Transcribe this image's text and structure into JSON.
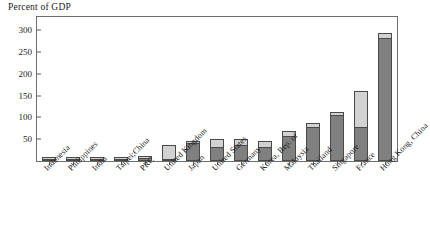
{
  "chart_data": {
    "type": "bar",
    "stacked": true,
    "title": "",
    "ylabel": "Percent of GDP",
    "xlabel": "",
    "ylim": [
      0,
      330
    ],
    "yticks": [
      50,
      100,
      150,
      200,
      250,
      300
    ],
    "grid": false,
    "legend_position": "top-left",
    "categories": [
      "Indonesia",
      "Philippines",
      "India",
      "Taipei;China",
      "PRC",
      "United Kingdom",
      "Japan",
      "United States",
      "Germany",
      "Korea, Rep. of",
      "Malaysia",
      "Thailand",
      "Singapore",
      "France",
      "Hong Kong, China"
    ],
    "series": [
      {
        "name": "Government",
        "color": "#808080",
        "values": [
          2,
          4,
          5,
          4,
          6,
          3,
          42,
          32,
          36,
          33,
          58,
          78,
          105,
          78,
          283
        ]
      },
      {
        "name": "Corporate",
        "color": "#d2d2d2",
        "values": [
          1,
          1,
          1,
          1,
          2,
          31,
          4,
          18,
          15,
          12,
          10,
          10,
          8,
          82,
          10
        ]
      }
    ],
    "totals": [
      3,
      5,
      6,
      5,
      8,
      34,
      46,
      50,
      51,
      45,
      68,
      88,
      113,
      160,
      293
    ]
  },
  "axis": {
    "y_title": "Percent of GDP",
    "tick_labels": [
      "300",
      "250",
      "200",
      "150",
      "100",
      "50"
    ]
  },
  "legend": {
    "items": [
      {
        "label": "Government",
        "swatch": "government-swatch"
      },
      {
        "label": "Corporate",
        "swatch": "corporate-swatch"
      }
    ]
  },
  "colors": {
    "government": "#808080",
    "corporate": "#d2d2d2",
    "frame": "#6e6e6e",
    "text": "#1a1a1a"
  }
}
